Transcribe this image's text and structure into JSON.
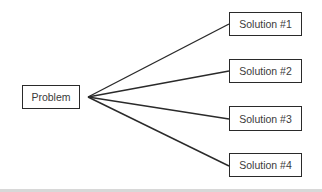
{
  "diagram": {
    "root": {
      "label": "Problem"
    },
    "children": [
      {
        "label": "Solution #1"
      },
      {
        "label": "Solution #2"
      },
      {
        "label": "Solution #3"
      },
      {
        "label": "Solution #4"
      }
    ],
    "colors": {
      "stroke": "#2a2a2a",
      "text": "#3a3a3a",
      "background": "#ffffff"
    }
  }
}
